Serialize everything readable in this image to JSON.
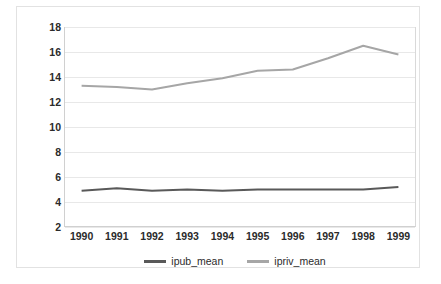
{
  "chart_data": {
    "type": "line",
    "title": "",
    "subtitle": "",
    "xlabel": "",
    "ylabel": "",
    "categories": [
      "1990",
      "1991",
      "1992",
      "1993",
      "1994",
      "1995",
      "1996",
      "1997",
      "1998",
      "1999"
    ],
    "yticks": [
      18,
      16,
      14,
      12,
      10,
      8,
      6,
      4,
      2
    ],
    "ylim": [
      2,
      18
    ],
    "grid": true,
    "legend_position": "bottom",
    "series": [
      {
        "name": "ipub_mean",
        "color": "#595959",
        "values": [
          4.9,
          5.1,
          4.9,
          5.0,
          4.9,
          5.0,
          5.0,
          5.0,
          5.0,
          5.2
        ]
      },
      {
        "name": "ipriv_mean",
        "color": "#a6a6a6",
        "values": [
          13.3,
          13.2,
          13.0,
          13.5,
          13.9,
          14.5,
          14.6,
          15.5,
          16.5,
          15.8
        ]
      }
    ]
  },
  "legend": {
    "entries": [
      {
        "label": "ipub_mean"
      },
      {
        "label": "ipriv_mean"
      }
    ]
  }
}
